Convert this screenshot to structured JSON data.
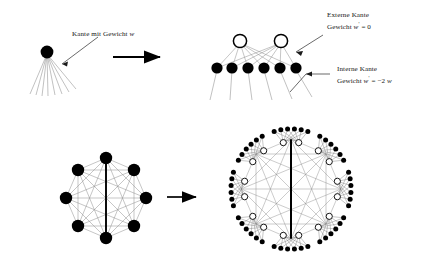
{
  "figure": {
    "type": "diagram",
    "caption_language": "German",
    "topic": "graph transformation gadget replacing a weighted edge",
    "labels": {
      "edge_weight": {
        "line1": "Kante mit Gewicht",
        "var": "w"
      },
      "external_edge": {
        "line1": "Externe Kante",
        "line2_prefix": "Gewicht",
        "line2_var": "w",
        "line2_prime": "'",
        "line2_rest": "= 0"
      },
      "internal_edge": {
        "line1": "Interne Kante",
        "line2_prefix": "Gewicht",
        "line2_var": "w",
        "line2_prime": "'",
        "line2_rest": "= −2",
        "line2_var2": "w"
      }
    },
    "arrows": [
      {
        "name": "top-transform-arrow",
        "direction": "right"
      },
      {
        "name": "bottom-transform-arrow",
        "direction": "right"
      }
    ],
    "panels": [
      {
        "name": "top-left-single-node",
        "nodes": [
          {
            "fill": "black",
            "count": 1
          }
        ],
        "fan_edges": 8
      },
      {
        "name": "top-right-gadget",
        "white_nodes": 2,
        "black_nodes": 6,
        "bipartite_complete": true,
        "fan_edges": 6
      },
      {
        "name": "bottom-left-complete-graph",
        "vertices": 8,
        "graph": "K8",
        "node_fill": "black",
        "highlighted_edge": "vertical"
      },
      {
        "name": "bottom-right-expanded-graph",
        "clusters": 8,
        "white_per_cluster": 2,
        "black_per_cluster": 6,
        "highlighted_edge": "vertical"
      }
    ],
    "colors": {
      "node_black": "#000000",
      "node_white_fill": "#ffffff",
      "node_stroke": "#000000",
      "edge_light": "#8d8d8d",
      "edge_bold": "#000000",
      "text": "#171717",
      "background": "#ffffff"
    }
  }
}
